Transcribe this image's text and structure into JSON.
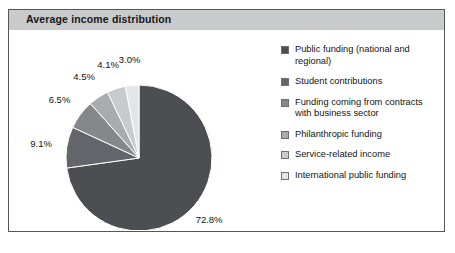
{
  "figure": {
    "title": "Average income distribution",
    "border_color": "#54565a",
    "title_bar_color": "#c9cacb"
  },
  "chart_data": {
    "type": "pie",
    "title": "Average income distribution",
    "xlabel": "",
    "ylabel": "",
    "legend_position": "right",
    "grid": false,
    "units": "percent",
    "start_angle_deg": 0,
    "direction": "clockwise",
    "categories": [
      "Public funding (national and regional)",
      "Student contributions",
      "Funding coming from contracts with business sector",
      "Philanthropic funding",
      "Service-related income",
      "International public funding"
    ],
    "values": [
      72.8,
      9.1,
      6.5,
      4.5,
      4.1,
      3.0
    ],
    "labels": [
      "72.8%",
      "9.1%",
      "6.5%",
      "4.5%",
      "4.1%",
      "3.0%"
    ],
    "colors": [
      "#4c4e52",
      "#63656a",
      "#85878b",
      "#a9abae",
      "#c8cacc",
      "#e4e5e6"
    ],
    "total": 100.0
  },
  "legend": {
    "items": [
      {
        "label": "Public funding (national and regional)",
        "color": "#4c4e52"
      },
      {
        "label": "Student contributions",
        "color": "#63656a"
      },
      {
        "label": "Funding coming from contracts with business sector",
        "color": "#85878b"
      },
      {
        "label": "Philanthropic funding",
        "color": "#a9abae"
      },
      {
        "label": "Service-related income",
        "color": "#c8cacc"
      },
      {
        "label": "International public funding",
        "color": "#e4e5e6"
      }
    ]
  }
}
